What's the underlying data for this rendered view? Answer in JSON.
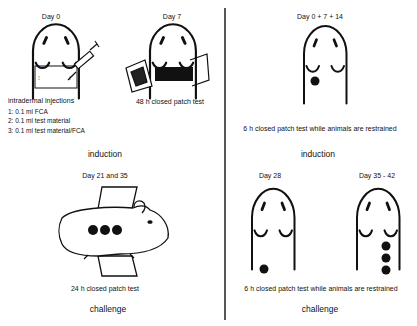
{
  "left_panel": {
    "title": "Maximization test",
    "induction": {
      "day0": {
        "label": "Day 0",
        "caption": "intradermal injections",
        "injections": [
          "1: 0.1 ml FCA",
          "2: 0.1 ml test material",
          "3: 0.1 ml test material/FCA"
        ]
      },
      "day7": {
        "label": "Day 7",
        "caption": "48 h closed patch test"
      },
      "phase_label": "induction"
    },
    "challenge": {
      "label": "Day 21 and 35",
      "caption": "24 h closed patch test",
      "phase_label": "challenge"
    }
  },
  "right_panel": {
    "induction": {
      "label": "Day 0 + 7 + 14",
      "caption": "6 h closed patch test while animals are restrained",
      "phase_label": "induction"
    },
    "challenge": {
      "day28": {
        "label": "Day 28"
      },
      "day35": {
        "label": "Day 35 - 42"
      },
      "caption": "6 h closed patch test while animals are restrained",
      "phase_label": "challenge"
    }
  },
  "colors": {
    "ink": "#111111",
    "background": "#ffffff"
  }
}
